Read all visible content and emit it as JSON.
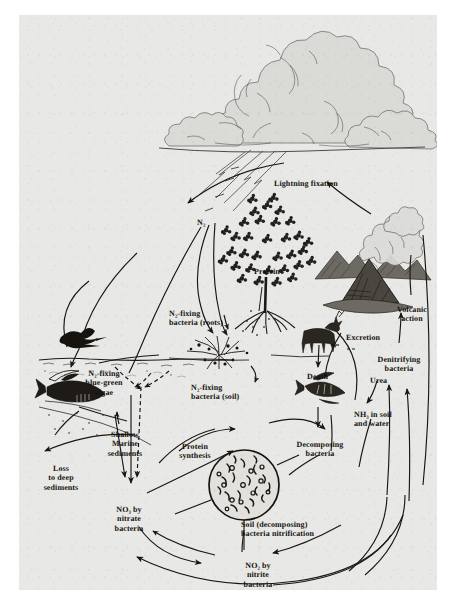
{
  "figure": {
    "medium": "engraved textbook plate, halftone scan",
    "background_color": "#e8e8e6",
    "ink_color": "#15130f",
    "page_color": "#ffffff"
  },
  "labels": [
    {
      "id": "lightning-fixation",
      "text": "Lightning fixation",
      "x": 255,
      "y": 160,
      "align": "left"
    },
    {
      "id": "n2",
      "text": "N₂",
      "x": 178,
      "y": 198,
      "align": "left"
    },
    {
      "id": "protein",
      "text": "Protein",
      "x": 235,
      "y": 247,
      "align": "left"
    },
    {
      "id": "volcanic-action",
      "text": "Volcanic\naction",
      "x": 392,
      "y": 288,
      "align": "center"
    },
    {
      "id": "excretion",
      "text": "Excretion",
      "x": 327,
      "y": 314,
      "align": "left"
    },
    {
      "id": "denitrifying-bacteria",
      "text": "Denitrifying\nbacteria",
      "x": 379,
      "y": 338,
      "align": "center"
    },
    {
      "id": "n2-fixing-bacteria-roots",
      "text": "N₂-fixing\nbacteria (roots)",
      "x": 170,
      "y": 291,
      "align": "left"
    },
    {
      "id": "death",
      "text": "Death",
      "x": 288,
      "y": 352,
      "align": "left"
    },
    {
      "id": "urea",
      "text": "Urea",
      "x": 351,
      "y": 356,
      "align": "left"
    },
    {
      "id": "n2-fixing-blue-green-algae",
      "text": "N₂-fixing\nblue-green\nalgae",
      "x": 85,
      "y": 355,
      "align": "center"
    },
    {
      "id": "n2-fixing-bacteria-soil",
      "text": "N₂-fixing\nbacteria (soil)",
      "x": 190,
      "y": 365,
      "align": "left"
    },
    {
      "id": "nh3-in-soil-and-water",
      "text": "NH₃  in soil\nand water",
      "x": 352,
      "y": 392,
      "align": "left"
    },
    {
      "id": "shallow-marine-sediments",
      "text": "Shallow\nMarine\nsediments",
      "x": 105,
      "y": 419,
      "align": "center"
    },
    {
      "id": "protein-synthesis",
      "text": "Protein\nsynthesis",
      "x": 175,
      "y": 424,
      "align": "center"
    },
    {
      "id": "decomposing-bacteria",
      "text": "Decomposing\nbacteria",
      "x": 300,
      "y": 424,
      "align": "center"
    },
    {
      "id": "loss-to-deep-sediments",
      "text": "Loss\nto deep\nsediments",
      "x": 40,
      "y": 450,
      "align": "center"
    },
    {
      "id": "no3-by-nitrate-bacteria",
      "text": "NO₃ by\nnitrate\nbacteria",
      "x": 109,
      "y": 490,
      "align": "center"
    },
    {
      "id": "soil-decomposing-bacteria-nitrification",
      "text": "Soil (decomposing)\nbacteria nitrification",
      "x": 243,
      "y": 503,
      "align": "left"
    },
    {
      "id": "no2-by-nitrite-bacteria",
      "text": "NO₂ by\nnitrite\nbacteria",
      "x": 239,
      "y": 545,
      "align": "center"
    }
  ],
  "scene_objects": [
    {
      "id": "cumulonimbus-cloud",
      "name": "thunderhead cloud"
    },
    {
      "id": "lightning-bolts",
      "name": "lightning strokes"
    },
    {
      "id": "deciduous-tree",
      "name": "leafy tree"
    },
    {
      "id": "mountain-range",
      "name": "mountains"
    },
    {
      "id": "erupting-volcano",
      "name": "volcano with ash plume"
    },
    {
      "id": "deer",
      "name": "grazing deer"
    },
    {
      "id": "flying-bird",
      "name": "seabird in flight"
    },
    {
      "id": "fish",
      "name": "fish in sea"
    },
    {
      "id": "fish-skeleton",
      "name": "dead fish / skeleton"
    },
    {
      "id": "root-nodules",
      "name": "legume root nodules"
    },
    {
      "id": "tree-roots",
      "name": "tree root system"
    },
    {
      "id": "microscope-field",
      "name": "circular microscope field of soil bacteria"
    },
    {
      "id": "sea-surface",
      "name": "ocean surface line"
    },
    {
      "id": "ground-line",
      "name": "soil surface line"
    }
  ]
}
